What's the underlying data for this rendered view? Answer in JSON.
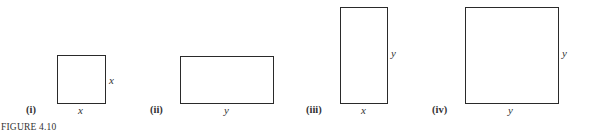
{
  "figure": {
    "caption": "FIGURE 4.10",
    "panels": [
      {
        "label": "(i)",
        "width_label": "x",
        "height_label": "x"
      },
      {
        "label": "(ii)",
        "width_label": "y",
        "height_label": ""
      },
      {
        "label": "(iii)",
        "width_label": "x",
        "height_label": "y"
      },
      {
        "label": "(iv)",
        "width_label": "y",
        "height_label": "y"
      }
    ]
  }
}
